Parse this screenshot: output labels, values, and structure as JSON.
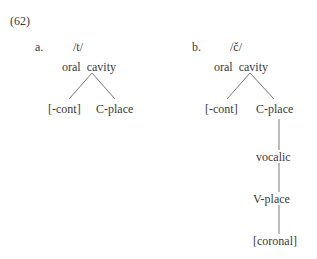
{
  "example_number": "(62)",
  "a": {
    "label": "a.",
    "segment": "/t/",
    "root": "oral  cavity",
    "children": [
      "[-cont]",
      "C-place"
    ]
  },
  "b": {
    "label": "b.",
    "segment": "/č/",
    "root": "oral  cavity",
    "children": [
      "[-cont]",
      "C-place"
    ],
    "chain": [
      "vocalic",
      "V-place",
      "[coronal]"
    ]
  }
}
